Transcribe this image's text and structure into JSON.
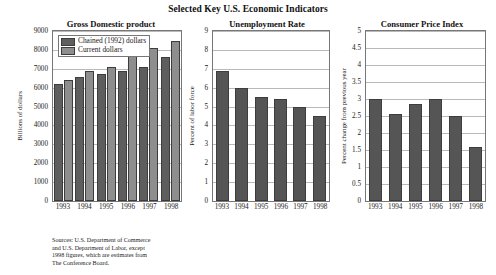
{
  "main_title": "Selected Key U.S. Economic Indicators",
  "source_note": {
    "line1": "Sources: U.S. Department of Commerce",
    "line2": "and U.S. Department of Labor, except",
    "line3": "1998 figures, which are estimates from",
    "line4": "The Conference Board."
  },
  "colors": {
    "series_dark": "#5e5e5e",
    "series_light": "#8e8e8e",
    "single_bar": "#555555",
    "frame": "#777777",
    "gridline": "#b9b9b9",
    "background": "#ffffff"
  },
  "charts": [
    {
      "id": "gdp",
      "title": "Gross Domestic product",
      "ylabel": "Billions of dollars",
      "yticks": [
        "0",
        "1000",
        "2000",
        "3000",
        "4000",
        "5000",
        "6000",
        "7000",
        "8000",
        "9000"
      ],
      "xticks": [
        "1993",
        "1994",
        "1995",
        "1996",
        "1997",
        "1998"
      ],
      "legend": [
        "Chained (1992) dollars",
        "Current dollars"
      ]
    },
    {
      "id": "unemployment",
      "title": "Unemployment Rate",
      "ylabel": "Percent of labor force",
      "yticks": [
        "0",
        "1",
        "2",
        "3",
        "4",
        "5",
        "6",
        "7",
        "8",
        "9"
      ],
      "xticks": [
        "1993",
        "1994",
        "1995",
        "1996",
        "1997",
        "1998"
      ],
      "legend": []
    },
    {
      "id": "cpi",
      "title": "Consumer Price Index",
      "ylabel": "Percent change from previous year",
      "yticks": [
        "0",
        "0.5",
        "1",
        "1.5",
        "2",
        "2.5",
        "3",
        "3.5",
        "4",
        "4.5",
        "5"
      ],
      "xticks": [
        "1993",
        "1994",
        "1995",
        "1996",
        "1997",
        "1998"
      ],
      "legend": []
    }
  ],
  "chart_data": [
    {
      "type": "bar",
      "title": "Gross Domestic product",
      "xlabel": "",
      "ylabel": "Billions of dollars",
      "ylim": [
        0,
        9000
      ],
      "ytick_step": 1000,
      "grid": true,
      "legend_position": "upper-left-inside",
      "categories": [
        "1993",
        "1994",
        "1995",
        "1996",
        "1997",
        "1998"
      ],
      "series": [
        {
          "name": "Chained (1992) dollars",
          "values": [
            6220,
            6560,
            6740,
            6890,
            7090,
            7600
          ]
        },
        {
          "name": "Current dollars",
          "values": [
            6420,
            6890,
            7100,
            7670,
            8100,
            8480
          ]
        }
      ]
    },
    {
      "type": "bar",
      "title": "Unemployment Rate",
      "xlabel": "",
      "ylabel": "Percent of labor force",
      "ylim": [
        0,
        9
      ],
      "ytick_step": 1,
      "grid": true,
      "legend_position": "none",
      "categories": [
        "1993",
        "1994",
        "1995",
        "1996",
        "1997",
        "1998"
      ],
      "values": [
        6.9,
        6.0,
        5.5,
        5.4,
        5.0,
        4.5
      ]
    },
    {
      "type": "bar",
      "title": "Consumer Price Index",
      "xlabel": "",
      "ylabel": "Percent change from previous year",
      "ylim": [
        0,
        5
      ],
      "ytick_step": 0.5,
      "grid": true,
      "legend_position": "none",
      "categories": [
        "1993",
        "1994",
        "1995",
        "1996",
        "1997",
        "1998"
      ],
      "values": [
        3.0,
        2.55,
        2.85,
        3.0,
        2.5,
        1.6
      ]
    }
  ]
}
